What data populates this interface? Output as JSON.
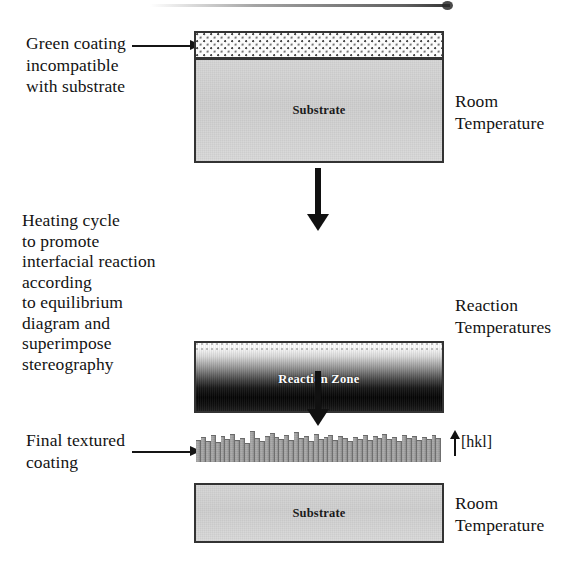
{
  "figure": {
    "type": "process-flow-diagram",
    "title_clipped": true,
    "substrate_label": "Substrate",
    "reaction_zone_label": "Reaction Zone",
    "hkl_label": "[hkl]"
  },
  "colors": {
    "substrate_fill": "#d4d4d4",
    "coating_stipple_bg": "#fbfbfb",
    "coating_stipple_dot": "#4a4a4a",
    "reaction_zone_top": "#ffffff",
    "reaction_zone_bottom": "#050505",
    "grain_fill": "#a3a3a3",
    "outline": "#333333",
    "arrow": "#111111",
    "text": "#131313"
  },
  "stages": [
    {
      "id": "stage-1",
      "left_caption": "Green coating\nincompatible\nwith substrate",
      "right_caption": "Room\nTemperature",
      "layers": [
        {
          "name": "green-coating",
          "label": ""
        },
        {
          "name": "substrate",
          "label": "Substrate"
        }
      ]
    },
    {
      "id": "stage-2",
      "left_caption": "Heating cycle\nto promote\ninterfacial reaction\naccording\nto equilibrium\ndiagram and\nsuperimpose\nstereography",
      "right_caption": "Reaction\nTemperatures",
      "layers": [
        {
          "name": "reaction-zone",
          "label": "Reaction Zone"
        },
        {
          "name": "substrate",
          "label": "Substrate"
        }
      ]
    },
    {
      "id": "stage-3",
      "left_caption": "Final textured\ncoating",
      "right_caption": "Room\nTemperature",
      "annotation": "[hkl]",
      "layers": [
        {
          "name": "textured-coating",
          "label": ""
        },
        {
          "name": "substrate",
          "label": "Substrate"
        }
      ]
    }
  ],
  "grain_heights": [
    22,
    25,
    21,
    27,
    20,
    26,
    23,
    28,
    22,
    24,
    19,
    31,
    24,
    21,
    26,
    29,
    25,
    23,
    27,
    22,
    30,
    24,
    26,
    21,
    28,
    23,
    25,
    27,
    22,
    26,
    24,
    21,
    25,
    23,
    27,
    22,
    26,
    24,
    28,
    23,
    25,
    21,
    27,
    24,
    26,
    22,
    25,
    23,
    27,
    24
  ]
}
